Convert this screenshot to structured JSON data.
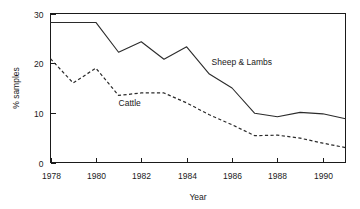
{
  "chart_data": {
    "type": "line",
    "title": "",
    "subtitle": "",
    "xlabel": "Year",
    "ylabel": "% samples",
    "xlim": [
      1978,
      1991
    ],
    "ylim": [
      0,
      30
    ],
    "xticks": [
      1978,
      1980,
      1982,
      1984,
      1986,
      1988,
      1990
    ],
    "xtick_labels": [
      "1978",
      "1980",
      "1982",
      "1984",
      "1986",
      "1988",
      "1990"
    ],
    "yticks": [
      0,
      10,
      20,
      30
    ],
    "ytick_labels": [
      "0",
      "10",
      "20",
      "30"
    ],
    "grid": false,
    "legend_position": "inline-annotation",
    "x": [
      1978,
      1979,
      1980,
      1981,
      1982,
      1983,
      1984,
      1985,
      1986,
      1987,
      1988,
      1989,
      1990,
      1991
    ],
    "series": [
      {
        "name": "Sheep & Lambs",
        "style": "solid",
        "color": "#2b2b2b",
        "values": [
          28.2,
          28.2,
          28.2,
          22.2,
          24.3,
          20.8,
          23.3,
          17.8,
          15.0,
          9.9,
          9.2,
          10.1,
          9.8,
          8.8
        ],
        "label_x": 1985.1,
        "label_y": 19.6
      },
      {
        "name": "Cattle",
        "style": "dashed",
        "color": "#2b2b2b",
        "values": [
          20.9,
          16.0,
          19.0,
          13.5,
          14.0,
          14.0,
          12.0,
          9.6,
          7.6,
          5.4,
          5.5,
          4.9,
          3.9,
          3.0
        ],
        "label_x": 1981.0,
        "label_y": 11.4
      }
    ],
    "annotations": [
      {
        "text": "Sheep & Lambs",
        "for_series": "Sheep & Lambs"
      },
      {
        "text": "Cattle",
        "for_series": "Cattle"
      }
    ]
  },
  "axes": {
    "y_title": "% samples",
    "x_title": "Year"
  }
}
